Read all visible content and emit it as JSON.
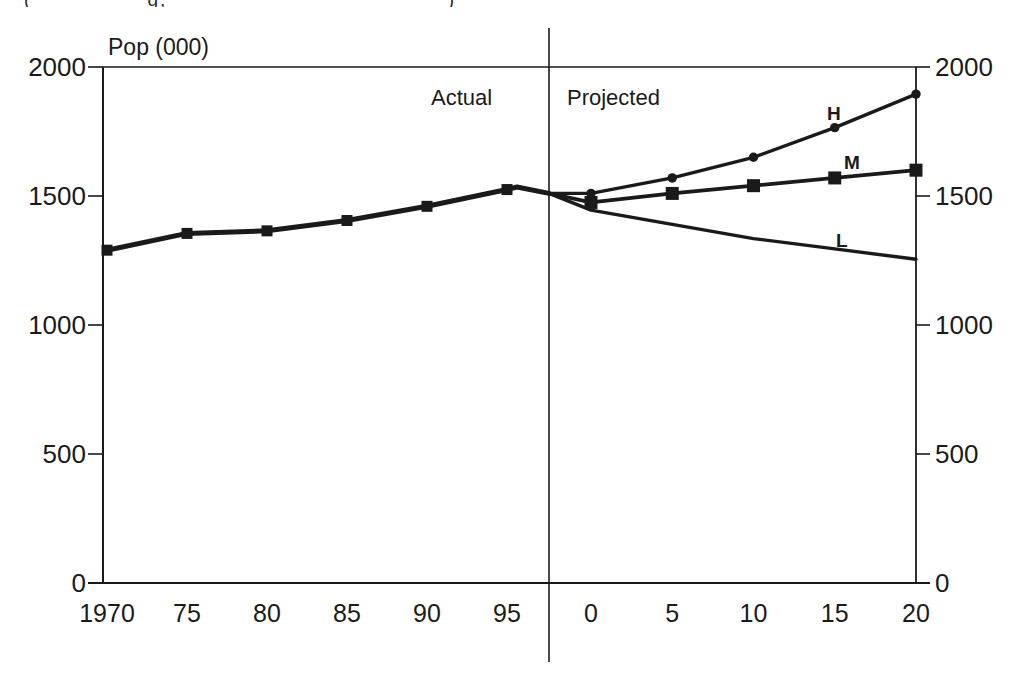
{
  "page": {
    "background": "#ffffff",
    "ink": "#1a1a1a"
  },
  "top_caption": {
    "clipped": true,
    "visible_fragment": "(____ ____ g, _____ ____ ____ _______)"
  },
  "chart_data": {
    "type": "line",
    "title": "Pop (000)",
    "section_labels": {
      "actual": "Actual",
      "projected": "Projected"
    },
    "y_axis": {
      "unit_label": "Pop (000)",
      "range": [
        0,
        2000
      ],
      "ticks": [
        0,
        500,
        1000,
        1500,
        2000
      ],
      "mirrored_right_axis": true,
      "grid": false
    },
    "x_axis": {
      "actual_years": [
        1970,
        1975,
        1980,
        1985,
        1990,
        1995
      ],
      "actual_tick_labels": [
        "1970",
        "75",
        "80",
        "85",
        "90",
        "95"
      ],
      "projected_offsets": [
        0,
        5,
        10,
        15,
        20
      ],
      "projected_tick_labels": [
        "0",
        "5",
        "10",
        "15",
        "20"
      ]
    },
    "junction": {
      "note_value_where_projections_split": 1510,
      "peak_after_1995": 1535
    },
    "series": [
      {
        "name": "actual",
        "label": "",
        "segment": "actual",
        "marker": "square",
        "x": [
          1970,
          1975,
          1980,
          1985,
          1990,
          1995
        ],
        "values": [
          1290,
          1355,
          1365,
          1405,
          1460,
          1525
        ]
      },
      {
        "name": "high",
        "label": "H",
        "segment": "projected",
        "marker": "circle",
        "x": [
          0,
          5,
          10,
          15,
          20
        ],
        "values": [
          1510,
          1570,
          1650,
          1765,
          1895
        ]
      },
      {
        "name": "medium",
        "label": "M",
        "segment": "projected",
        "marker": "square",
        "x": [
          0,
          5,
          10,
          15,
          20
        ],
        "values": [
          1475,
          1510,
          1540,
          1570,
          1600
        ]
      },
      {
        "name": "low",
        "label": "L",
        "segment": "projected",
        "marker": "none",
        "x": [
          0,
          5,
          10,
          15,
          20
        ],
        "values": [
          1445,
          1390,
          1335,
          1295,
          1255
        ]
      }
    ]
  }
}
